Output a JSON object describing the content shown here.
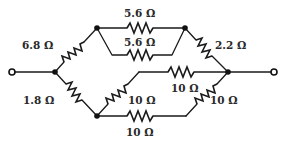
{
  "diagram": {
    "type": "resistor-network",
    "terminals": [
      {
        "id": "in",
        "label": "left terminal",
        "x": 12,
        "y": 72
      },
      {
        "id": "out",
        "label": "right terminal",
        "x": 274,
        "y": 72
      }
    ],
    "nodes": [
      {
        "id": "A",
        "x": 55,
        "y": 72
      },
      {
        "id": "B",
        "x": 97,
        "y": 28
      },
      {
        "id": "C",
        "x": 185,
        "y": 28
      },
      {
        "id": "D",
        "x": 228,
        "y": 72
      },
      {
        "id": "E",
        "x": 97,
        "y": 116
      }
    ],
    "resistors": [
      {
        "id": "R1",
        "label": "6.8 Ω",
        "value_ohms": 6.8,
        "from": "A",
        "to": "B"
      },
      {
        "id": "R2",
        "label": "5.6 Ω",
        "value_ohms": 5.6,
        "from": "B",
        "to": "C",
        "path": "top"
      },
      {
        "id": "R3",
        "label": "5.6 Ω",
        "value_ohms": 5.6,
        "from": "B",
        "to": "C",
        "path": "lower"
      },
      {
        "id": "R4",
        "label": "2.2 Ω",
        "value_ohms": 2.2,
        "from": "C",
        "to": "D"
      },
      {
        "id": "R5",
        "label": "1.8 Ω",
        "value_ohms": 1.8,
        "from": "A",
        "to": "E"
      },
      {
        "id": "R6",
        "label": "10 Ω",
        "value_ohms": 10,
        "from": "E",
        "to": "mid",
        "path": "diagonal"
      },
      {
        "id": "R7",
        "label": "10 Ω",
        "value_ohms": 10,
        "from": "mid",
        "to": "D",
        "path": "horizontal"
      },
      {
        "id": "R8",
        "label": "10 Ω",
        "value_ohms": 10,
        "from": "E",
        "to": "lowmid",
        "path": "bottom"
      },
      {
        "id": "R9",
        "label": "10 Ω",
        "value_ohms": 10,
        "from": "lowmid",
        "to": "D",
        "path": "diagonal"
      }
    ]
  }
}
